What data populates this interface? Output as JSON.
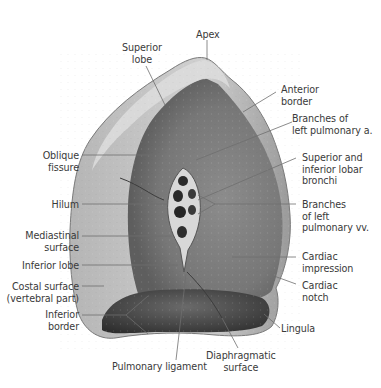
{
  "figure": {
    "colors": {
      "lung_light": "#c9c9c9",
      "lung_mid": "#9e9e9e",
      "lung_dark": "#4a4a4a",
      "leader_line": "#6f6f6f",
      "label_text": "#3a3a3a"
    }
  },
  "labels": {
    "apex": [
      "Apex"
    ],
    "superior_lobe": [
      "Superior",
      "lobe"
    ],
    "anterior_border": [
      "Anterior",
      "border"
    ],
    "branches_pulmonary_a": [
      "Branches of",
      "left pulmonary a."
    ],
    "oblique_fissure": [
      "Oblique",
      "fissure"
    ],
    "lobar_bronchi": [
      "Superior and",
      "inferior lobar",
      "bronchi"
    ],
    "hilum": [
      "Hilum"
    ],
    "branches_pulmonary_vv": [
      "Branches",
      "of left",
      "pulmonary vv."
    ],
    "mediastinal_surface": [
      "Mediastinal",
      "surface"
    ],
    "inferior_lobe": [
      "Inferior lobe"
    ],
    "cardiac_impression": [
      "Cardiac",
      "impression"
    ],
    "costal_surface": [
      "Costal surface",
      "(vertebral part)"
    ],
    "cardiac_notch": [
      "Cardiac",
      "notch"
    ],
    "inferior_border": [
      "Inferior",
      "border"
    ],
    "lingula": [
      "Lingula"
    ],
    "pulmonary_ligament": [
      "Pulmonary ligament"
    ],
    "diaphragmatic_surface": [
      "Diaphragmatic",
      "surface"
    ]
  }
}
